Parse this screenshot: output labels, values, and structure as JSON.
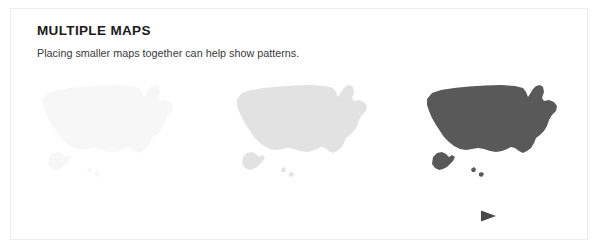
{
  "figure": {
    "title": "MULTIPLE MAPS",
    "subtitle": "Placing smaller maps together can help show patterns.",
    "border_color": "#ececec",
    "background_color": "#ffffff",
    "title_color": "#1a1a1a",
    "subtitle_color": "#3a3a3a"
  },
  "maps": [
    {
      "name": "united-states-map-lightest",
      "region": "United States",
      "fill": "#f7f7f7",
      "shade_label": "lightest",
      "step": 1
    },
    {
      "name": "united-states-map-light",
      "region": "United States",
      "fill": "#e2e2e2",
      "shade_label": "light",
      "step": 2
    },
    {
      "name": "united-states-map-dark",
      "region": "United States",
      "fill": "#595959",
      "shade_label": "dark",
      "step": 3
    }
  ],
  "arrow": {
    "name": "progression-arrow",
    "direction": "right",
    "start_color": "#fbfbfb",
    "end_color": "#4a4a4a"
  }
}
